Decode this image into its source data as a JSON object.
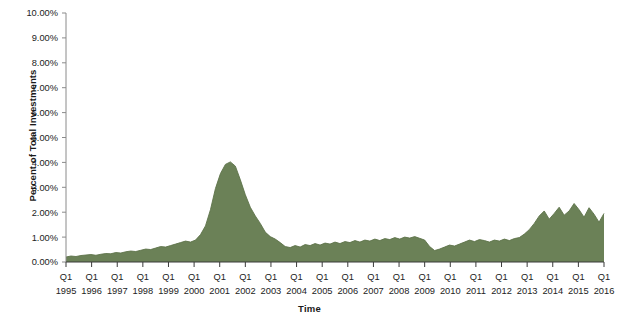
{
  "chart_data": {
    "type": "area",
    "title": "",
    "xlabel": "Time",
    "ylabel": "Percent of Total Investments",
    "ylim": [
      0,
      10
    ],
    "ytick_labels": [
      "0.00%",
      "1.00%",
      "2.00%",
      "3.00%",
      "4.00%",
      "5.00%",
      "6.00%",
      "7.00%",
      "8.00%",
      "9.00%",
      "10.00%"
    ],
    "ytick_values": [
      0,
      1,
      2,
      3,
      4,
      5,
      6,
      7,
      8,
      9,
      10
    ],
    "xtick_quarter_label": "Q1",
    "xtick_year_labels": [
      "1995",
      "1996",
      "1997",
      "1998",
      "1999",
      "2000",
      "2001",
      "2002",
      "2003",
      "2004",
      "2005",
      "2006",
      "2007",
      "2008",
      "2009",
      "2010",
      "2011",
      "2012",
      "2013",
      "2014",
      "2015",
      "2016"
    ],
    "grid": false,
    "legend": null,
    "series_color": "#6b8157",
    "series_edge_color": "#5d7349",
    "x_period_start": "1995 Q1",
    "x_period_end": "2016 Q1",
    "x_period_labels": [
      "1995 Q1",
      "1995 Q2",
      "1995 Q3",
      "1995 Q4",
      "1996 Q1",
      "1996 Q2",
      "1996 Q3",
      "1996 Q4",
      "1997 Q1",
      "1997 Q2",
      "1997 Q3",
      "1997 Q4",
      "1998 Q1",
      "1998 Q2",
      "1998 Q3",
      "1998 Q4",
      "1999 Q1",
      "1999 Q2",
      "1999 Q3",
      "1999 Q4",
      "2000 Q1",
      "2000 Q2",
      "2000 Q3",
      "2000 Q4",
      "2001 Q1",
      "2001 Q2",
      "2001 Q3",
      "2001 Q4",
      "2002 Q1",
      "2002 Q2",
      "2002 Q3",
      "2002 Q4",
      "2003 Q1",
      "2003 Q2",
      "2003 Q3",
      "2003 Q4",
      "2004 Q1",
      "2004 Q2",
      "2004 Q3",
      "2004 Q4",
      "2005 Q1",
      "2005 Q2",
      "2005 Q3",
      "2005 Q4",
      "2006 Q1",
      "2006 Q2",
      "2006 Q3",
      "2006 Q4",
      "2007 Q1",
      "2007 Q2",
      "2007 Q3",
      "2007 Q4",
      "2008 Q1",
      "2008 Q2",
      "2008 Q3",
      "2008 Q4",
      "2009 Q1",
      "2009 Q2",
      "2009 Q3",
      "2009 Q4",
      "2010 Q1",
      "2010 Q2",
      "2010 Q3",
      "2010 Q4",
      "2011 Q1",
      "2011 Q2",
      "2011 Q3",
      "2011 Q4",
      "2012 Q1",
      "2012 Q2",
      "2012 Q3",
      "2012 Q4",
      "2013 Q1",
      "2013 Q2",
      "2013 Q3",
      "2013 Q4",
      "2014 Q1",
      "2014 Q2",
      "2014 Q3",
      "2014 Q4",
      "2015 Q1",
      "2015 Q2",
      "2015 Q3",
      "2015 Q4",
      "2016 Q1"
    ],
    "values": [
      0.2,
      0.24,
      0.22,
      0.26,
      0.28,
      0.3,
      0.27,
      0.31,
      0.34,
      0.33,
      0.38,
      0.36,
      0.41,
      0.44,
      0.42,
      0.47,
      0.52,
      0.5,
      0.56,
      0.62,
      0.6,
      0.66,
      0.72,
      0.78,
      0.84,
      0.8,
      0.88,
      1.1,
      1.45,
      2.1,
      2.95,
      3.55,
      3.92,
      4.02,
      3.85,
      3.3,
      2.7,
      2.2,
      1.85,
      1.55,
      1.2,
      1.02,
      0.92,
      0.78,
      0.62,
      0.58,
      0.66,
      0.6,
      0.7,
      0.66,
      0.74,
      0.68,
      0.76,
      0.72,
      0.8,
      0.74,
      0.82,
      0.78,
      0.86,
      0.8,
      0.88,
      0.84,
      0.92,
      0.86,
      0.94,
      0.9,
      0.98,
      0.92,
      1.0,
      0.96,
      1.02,
      0.95,
      0.88,
      0.62,
      0.46,
      0.52,
      0.6,
      0.68,
      0.64,
      0.72,
      0.8,
      0.88,
      0.82,
      0.9,
      0.86,
      0.8,
      0.88,
      0.84,
      0.92,
      0.86,
      0.94,
      0.98,
      1.12,
      1.3,
      1.55,
      1.85,
      2.05,
      1.72,
      1.95,
      2.2,
      1.88,
      2.05,
      2.35,
      2.1,
      1.8,
      2.18,
      1.92,
      1.6,
      1.95
    ],
    "peak_value": 4.02,
    "peak_period": "2000 Q2",
    "trough_value": 0.2,
    "trough_period": "1995 Q1",
    "final_value": 1.95
  }
}
